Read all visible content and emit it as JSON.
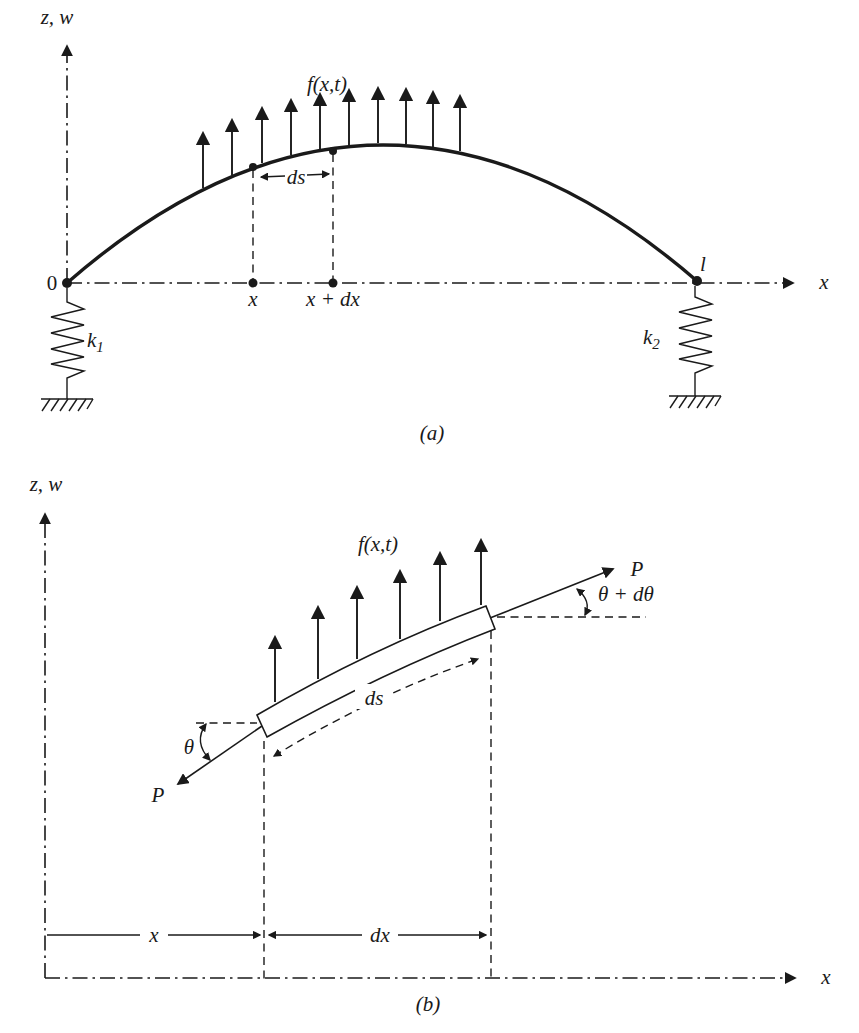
{
  "figure": {
    "colors": {
      "ink": "#1a1a1a",
      "background": "#ffffff"
    },
    "part_a": {
      "caption": "(a)",
      "z_axis_label": "z, w",
      "x_axis_label": "x",
      "origin_label": "0",
      "load_label": "f(x,t)",
      "ds_label": "ds",
      "x_point_label": "x",
      "x_dx_point_label": "x + dx",
      "length_label": "l",
      "spring_left": {
        "base": "k",
        "sub": "1"
      },
      "spring_right": {
        "base": "k",
        "sub": "2"
      }
    },
    "part_b": {
      "caption": "(b)",
      "z_axis_label": "z, w",
      "x_axis_label": "x",
      "load_label": "f(x,t)",
      "tension_upper_label": "P",
      "tension_lower_label": "P",
      "angle_label": "θ",
      "angle_increment_label": "θ + dθ",
      "ds_label": "ds",
      "dim_x_label": "x",
      "dim_dx_label": "dx"
    }
  }
}
